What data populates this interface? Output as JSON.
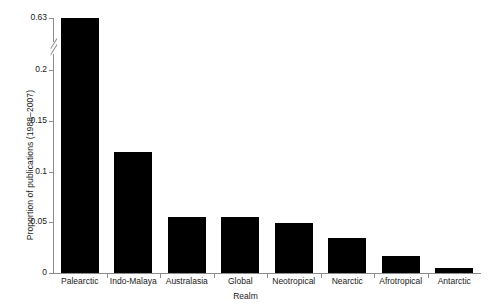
{
  "chart_data": {
    "type": "bar",
    "title": "",
    "xlabel": "Realm",
    "ylabel": "Proportion of publications (1988–2007)",
    "categories": [
      "Palearctic",
      "Indo-Malaya",
      "Australasia",
      "Global",
      "Neotropical",
      "Nearctic",
      "Afrotropical",
      "Antarctic"
    ],
    "values": [
      0.63,
      0.119,
      0.055,
      0.055,
      0.049,
      0.034,
      0.017,
      0.005
    ],
    "ytick_labels": [
      "0",
      "0.05",
      "0.1",
      "0.15",
      "0.2",
      "0.63"
    ],
    "ytick_values": [
      0,
      0.05,
      0.1,
      0.15,
      0.2,
      0.63
    ],
    "ylim": [
      0,
      0.63
    ],
    "axis_break": {
      "present": true,
      "between": [
        0.2,
        0.63
      ]
    },
    "grid": false,
    "legend": null,
    "bar_color": "#000000",
    "axis_color": "#8c8c8c",
    "text_color": "#1a1a1a"
  },
  "axes": {
    "y_title": "Proportion of publications (1988–2007)",
    "x_title": "Realm"
  }
}
